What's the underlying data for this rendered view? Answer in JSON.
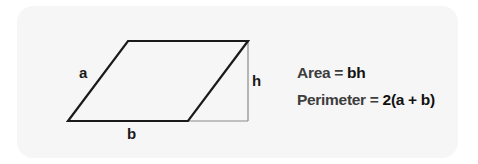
{
  "diagram": {
    "shape": "parallelogram",
    "labels": {
      "side": "a",
      "base": "b",
      "height": "h"
    },
    "colors": {
      "card_background": "#f6f6f6",
      "outline": "#1a1a1a",
      "height_guide": "#8a8a8a"
    }
  },
  "formulas": [
    {
      "label": "Area = ",
      "value": "bh"
    },
    {
      "label": "Perimeter = ",
      "value": "2(a + b)"
    }
  ]
}
